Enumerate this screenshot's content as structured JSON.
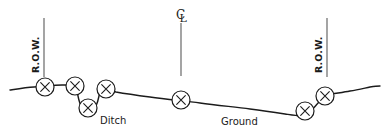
{
  "diagram": {
    "type": "engineering-cross-section",
    "title_visible": false,
    "background_color": "#ffffff",
    "line_color": "#1b1b1b",
    "reference_line_color": "#5a5a5a",
    "labels": {
      "ditch": "Ditch",
      "ground": "Ground",
      "row_left": "R.O.W.",
      "row_right": "R.O.W.",
      "centerline_symbol": "℄",
      "centerline_c": "C",
      "centerline_l": "L"
    },
    "reference_lines": [
      {
        "name": "row-left-line",
        "x": 44,
        "y_top": 18,
        "y_bottom": 77,
        "label": "R.O.W."
      },
      {
        "name": "centerline",
        "x": 181,
        "y_top": 23,
        "y_bottom": 76,
        "label": "℄"
      },
      {
        "name": "row-right-line",
        "x": 327,
        "y_top": 18,
        "y_bottom": 77,
        "label": "R.O.W."
      }
    ],
    "ground_profile": {
      "description": "Natural ground surface with a ditch near the left right-of-way and a rising bank at the right right-of-way",
      "points": [
        {
          "x": 10,
          "y": 90
        },
        {
          "x": 34,
          "y": 87
        },
        {
          "x": 62,
          "y": 85
        },
        {
          "x": 76,
          "y": 86
        },
        {
          "x": 78,
          "y": 96
        },
        {
          "x": 82,
          "y": 107
        },
        {
          "x": 90,
          "y": 111
        },
        {
          "x": 96,
          "y": 106
        },
        {
          "x": 99,
          "y": 96
        },
        {
          "x": 101,
          "y": 89
        },
        {
          "x": 116,
          "y": 92
        },
        {
          "x": 150,
          "y": 97
        },
        {
          "x": 200,
          "y": 103
        },
        {
          "x": 250,
          "y": 109
        },
        {
          "x": 285,
          "y": 114
        },
        {
          "x": 300,
          "y": 116
        },
        {
          "x": 310,
          "y": 112
        },
        {
          "x": 320,
          "y": 101
        },
        {
          "x": 332,
          "y": 94
        },
        {
          "x": 350,
          "y": 91
        },
        {
          "x": 370,
          "y": 87
        },
        {
          "x": 380,
          "y": 86
        }
      ]
    },
    "markers": [
      {
        "name": "survey-point-1",
        "symbol": "X",
        "x": 45,
        "y": 87,
        "r": 9
      },
      {
        "name": "survey-point-2",
        "symbol": "X",
        "x": 75,
        "y": 86,
        "r": 9
      },
      {
        "name": "survey-point-3",
        "symbol": "X",
        "x": 88,
        "y": 108,
        "r": 9
      },
      {
        "name": "survey-point-4",
        "symbol": "X",
        "x": 106,
        "y": 89,
        "r": 9
      },
      {
        "name": "survey-point-5",
        "symbol": "X",
        "x": 181,
        "y": 100,
        "r": 9
      },
      {
        "name": "survey-point-6",
        "symbol": "X",
        "x": 305,
        "y": 111,
        "r": 9
      },
      {
        "name": "survey-point-7",
        "symbol": "X",
        "x": 325,
        "y": 96,
        "r": 9
      }
    ],
    "text_labels": [
      {
        "name": "ditch-label",
        "text": "Ditch",
        "x": 100,
        "y": 124
      },
      {
        "name": "ground-label",
        "text": "Ground",
        "x": 221,
        "y": 125
      }
    ],
    "marker_count": 7,
    "marker_symbol": "X"
  }
}
